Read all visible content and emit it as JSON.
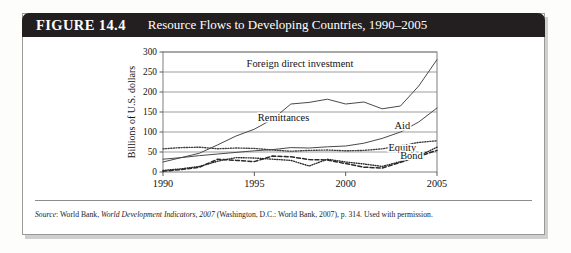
{
  "figure": {
    "number_label": "FIGURE 14.4",
    "title": "Resource Flows to Developing Countries, 1990–2005",
    "source_prefix": "Source",
    "source_sep": ": ",
    "source_publisher": "World Bank, ",
    "source_italic": "World Development Indicators, 2007",
    "source_rest": " (Washington, D.C.: World Bank, 2007), p. 314. Used with permission."
  },
  "chart_data": {
    "type": "line",
    "title": "Resource Flows to Developing Countries, 1990–2005",
    "xlabel": "",
    "ylabel": "Billions of U.S. dollars",
    "xlim": [
      1990,
      2005
    ],
    "ylim": [
      0,
      300
    ],
    "grid": true,
    "grid_axis": "y",
    "legend_position": "inline-annotations",
    "x": [
      1990,
      1991,
      1992,
      1993,
      1994,
      1995,
      1996,
      1997,
      1998,
      1999,
      2000,
      2001,
      2002,
      2003,
      2004,
      2005
    ],
    "xticks": [
      1990,
      1995,
      2000,
      2005
    ],
    "xticklabels": [
      "1990",
      "1995",
      "2000",
      "2005"
    ],
    "yticks": [
      0,
      50,
      100,
      150,
      200,
      250,
      300
    ],
    "yticklabels": [
      "0",
      "50",
      "100",
      "150",
      "200",
      "250",
      "300"
    ],
    "series": [
      {
        "name": "Foreign direct investment",
        "label": "Foreign direct investment",
        "style": "solid",
        "color": "#3f3f3f",
        "values": [
          25,
          36,
          47,
          68,
          90,
          107,
          132,
          170,
          174,
          182,
          170,
          175,
          158,
          165,
          215,
          281
        ]
      },
      {
        "name": "Remittances",
        "label": "Remittances",
        "style": "solid",
        "color": "#3f3f3f",
        "values": [
          32,
          36,
          41,
          45,
          49,
          53,
          56,
          61,
          60,
          63,
          65,
          72,
          84,
          100,
          125,
          160
        ]
      },
      {
        "name": "Aid",
        "label": "Aid",
        "style": "dotted-coarse",
        "color": "#3f3f3f",
        "values": [
          58,
          61,
          62,
          58,
          60,
          59,
          55,
          52,
          54,
          55,
          53,
          54,
          58,
          66,
          74,
          78
        ]
      },
      {
        "name": "Equity",
        "label": "Equity",
        "style": "dotted-fine",
        "color": "#2a2a2a",
        "values": [
          4,
          8,
          14,
          27,
          36,
          35,
          32,
          29,
          15,
          32,
          25,
          20,
          14,
          26,
          40,
          62
        ]
      },
      {
        "name": "Bond",
        "label": "Bond",
        "style": "dashed",
        "color": "#2a2a2a",
        "values": [
          2,
          6,
          12,
          32,
          29,
          26,
          40,
          38,
          31,
          30,
          21,
          12,
          10,
          24,
          39,
          54
        ]
      }
    ],
    "annotations": [
      {
        "text": "Foreign direct investment",
        "x": 1997.5,
        "y": 262
      },
      {
        "text": "Remittances",
        "x": 1996.6,
        "y": 128
      },
      {
        "text": "Aid",
        "x": 2003.1,
        "y": 108
      },
      {
        "text": "Equity",
        "x": 2003.1,
        "y": 52
      },
      {
        "text": "Bond",
        "x": 2003.6,
        "y": 33
      }
    ]
  }
}
